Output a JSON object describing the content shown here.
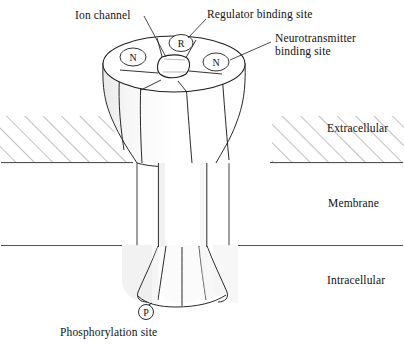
{
  "figure": {
    "background_color": "#ffffff",
    "line_color": "#1a1a1a",
    "hatch_color": "#555555"
  },
  "callouts": {
    "ion_channel": {
      "text": "Ion channel",
      "x": 75,
      "y": 9
    },
    "regulator_binding_site": {
      "text": "Regulator binding site",
      "x": 207,
      "y": 8
    },
    "neurotransmitter_binding_site": {
      "text": "Neurotransmitter\nbinding site",
      "x": 275,
      "y": 32
    },
    "phosphorylation_site": {
      "text": "Phosphorylation site",
      "x": 60,
      "y": 326
    }
  },
  "regions": {
    "extracellular": {
      "text": "Extracellular",
      "x": 327,
      "y": 122
    },
    "membrane": {
      "text": "Membrane",
      "x": 328,
      "y": 197
    },
    "intracellular": {
      "text": "Intracellular",
      "x": 327,
      "y": 274
    }
  },
  "subunits": [
    {
      "letter": "N",
      "name": "neurotransmitter-subunit-left",
      "x": 133,
      "y": 57
    },
    {
      "letter": "R",
      "name": "regulator-subunit",
      "x": 181,
      "y": 43
    },
    {
      "letter": "N",
      "name": "neurotransmitter-subunit-right",
      "x": 216,
      "y": 62
    },
    {
      "letter": "P",
      "name": "phosphorylation-marker",
      "x": 146,
      "y": 312
    }
  ]
}
